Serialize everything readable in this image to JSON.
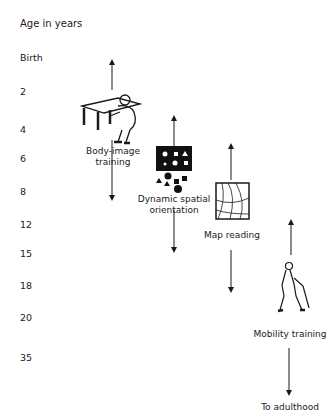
{
  "axis": {
    "title": "Age in years",
    "ticks": [
      {
        "label": "Birth",
        "top": 52
      },
      {
        "label": "2",
        "top": 86
      },
      {
        "label": "4",
        "top": 124
      },
      {
        "label": "6",
        "top": 153
      },
      {
        "label": "8",
        "top": 186
      },
      {
        "label": "12",
        "top": 219
      },
      {
        "label": "15",
        "top": 248
      },
      {
        "label": "18",
        "top": 280
      },
      {
        "label": "20",
        "top": 312
      },
      {
        "label": "35",
        "top": 352
      }
    ]
  },
  "stages": [
    {
      "id": "body-image",
      "label_line1": "Body-image",
      "label_line2": "training",
      "icon": "person-at-table-icon"
    },
    {
      "id": "spatial",
      "label_line1": "Dynamic spatial",
      "label_line2": "orientation",
      "icon": "shapes-board-icon"
    },
    {
      "id": "map",
      "label_line1": "Map reading",
      "label_line2": "",
      "icon": "map-icon"
    },
    {
      "id": "mobility",
      "label_line1": "Mobility training",
      "label_line2": "",
      "icon": "person-with-cane-icon"
    }
  ],
  "footer": {
    "label": "To adulthood"
  }
}
